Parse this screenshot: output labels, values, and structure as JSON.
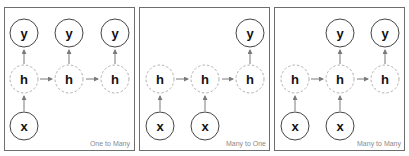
{
  "colors": {
    "panel_border": "#6e6e6e",
    "solid_node_stroke": "#444444",
    "hidden_node_stroke": "#b0b0b0",
    "arrow": "#7a7a7a",
    "caption": "#8a8a8a"
  },
  "panels": [
    {
      "caption": "One to Many",
      "nodes": {
        "y": [
          "y",
          "y",
          "y"
        ],
        "h": [
          "h",
          "h",
          "h"
        ],
        "x": [
          "x"
        ]
      }
    },
    {
      "caption": "Many to One",
      "nodes": {
        "y": [
          "y"
        ],
        "h": [
          "h",
          "h",
          "h"
        ],
        "x": [
          "x",
          "x"
        ]
      }
    },
    {
      "caption": "Many to Many",
      "nodes": {
        "y": [
          "y",
          "y"
        ],
        "h": [
          "h",
          "h",
          "h"
        ],
        "x": [
          "x",
          "x"
        ]
      }
    }
  ]
}
